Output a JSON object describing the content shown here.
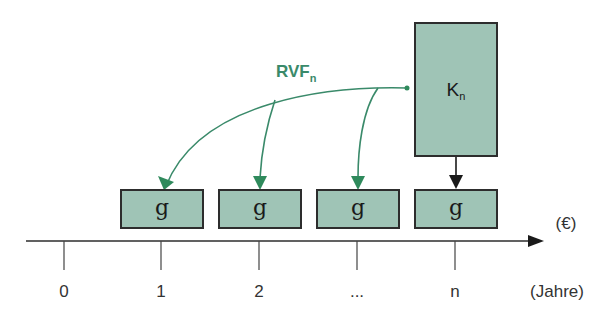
{
  "diagram": {
    "type": "cash-flow-timeline",
    "rvf_label": {
      "main": "RVF",
      "sub": "n"
    },
    "capital_box": {
      "main": "K",
      "sub": "n"
    },
    "payment_boxes": [
      {
        "label": "g",
        "period": "1"
      },
      {
        "label": "g",
        "period": "2"
      },
      {
        "label": "g",
        "period": "..."
      },
      {
        "label": "g",
        "period": "n"
      }
    ],
    "axis": {
      "unit_label": "(€)",
      "time_label": "(Jahre)",
      "ticks": [
        "0",
        "1",
        "2",
        "...",
        "n"
      ]
    },
    "colors": {
      "box_fill": "#9fc4b6",
      "arrow_green": "#3a8a6a",
      "axis": "#2d2d2d"
    }
  }
}
